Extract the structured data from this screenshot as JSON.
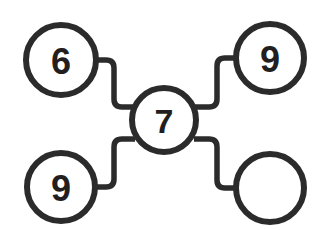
{
  "diagram": {
    "type": "node-link-graph",
    "title": "",
    "background_color": "#ffffff",
    "stroke_color": "#2b2b2b",
    "label_color": "#231f20",
    "node_stroke_width": 6,
    "connector_stroke_width": 5.5,
    "node_count": 5,
    "edge_count": 4,
    "nodes": [
      {
        "id": "node-top-left",
        "label": "6",
        "has_label": true,
        "cx": 61,
        "cy": 60,
        "r": 35,
        "font_size": 36
      },
      {
        "id": "node-top-right",
        "label": "9",
        "has_label": true,
        "cx": 270,
        "cy": 58,
        "r": 34,
        "font_size": 36
      },
      {
        "id": "node-center",
        "label": "7",
        "has_label": true,
        "cx": 164,
        "cy": 120,
        "r": 32,
        "font_size": 34
      },
      {
        "id": "node-bottom-left",
        "label": "9",
        "has_label": true,
        "cx": 61,
        "cy": 187,
        "r": 34,
        "font_size": 36
      },
      {
        "id": "node-bottom-right",
        "label": "",
        "has_label": false,
        "cx": 270,
        "cy": 188,
        "r": 34,
        "font_size": 36
      }
    ],
    "edges": [
      {
        "id": "edge-top-left-to-center",
        "from": "node-top-left",
        "to": "node-center",
        "path": "M 94 60 L 106 60 Q 114 60 114 68 L 114 99 Q 114 107 122 107 L 135 107"
      },
      {
        "id": "edge-top-right-to-center",
        "from": "node-top-right",
        "to": "node-center",
        "path": "M 237 58 L 225 58 Q 217 58 217 66 L 217 99 Q 217 107 209 107 L 194 107"
      },
      {
        "id": "edge-bottom-left-to-center",
        "from": "node-bottom-left",
        "to": "node-center",
        "path": "M 94 187 L 106 187 Q 114 187 114 179 L 114 147 Q 114 139 122 139 L 135 139"
      },
      {
        "id": "edge-bottom-right-to-center",
        "from": "node-bottom-right",
        "to": "node-center",
        "path": "M 237 188 L 225 188 Q 217 188 217 180 L 217 147 Q 217 139 209 139 L 194 139"
      }
    ]
  }
}
